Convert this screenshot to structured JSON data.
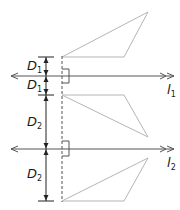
{
  "diagram": {
    "labels": {
      "d1_upper": {
        "main": "D",
        "sub": "1"
      },
      "d1_lower": {
        "main": "D",
        "sub": "1"
      },
      "d2_upper": {
        "main": "D",
        "sub": "2"
      },
      "d2_lower": {
        "main": "D",
        "sub": "2"
      },
      "line1": {
        "main": "l",
        "sub": "1"
      },
      "line2": {
        "main": "l",
        "sub": "2"
      }
    },
    "colors": {
      "triangle": "#b5b5b5",
      "line": "#555555",
      "text": "#1a1a1a"
    }
  }
}
